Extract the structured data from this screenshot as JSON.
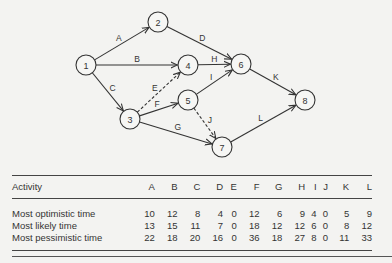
{
  "network": {
    "nodes": [
      {
        "id": "1",
        "label": "1",
        "x": 86,
        "y": 65
      },
      {
        "id": "2",
        "label": "2",
        "x": 158,
        "y": 22
      },
      {
        "id": "3",
        "label": "3",
        "x": 130,
        "y": 119
      },
      {
        "id": "4",
        "label": "4",
        "x": 188,
        "y": 65
      },
      {
        "id": "5",
        "label": "5",
        "x": 188,
        "y": 100
      },
      {
        "id": "6",
        "label": "6",
        "x": 241,
        "y": 64
      },
      {
        "id": "7",
        "label": "7",
        "x": 222,
        "y": 147
      },
      {
        "id": "8",
        "label": "8",
        "x": 305,
        "y": 100
      }
    ],
    "edges": [
      {
        "label": "A",
        "from": "1",
        "to": "2",
        "dashed": false
      },
      {
        "label": "B",
        "from": "1",
        "to": "4",
        "dashed": false
      },
      {
        "label": "C",
        "from": "1",
        "to": "3",
        "dashed": false
      },
      {
        "label": "D",
        "from": "2",
        "to": "6",
        "dashed": false
      },
      {
        "label": "E",
        "from": "3",
        "to": "4",
        "dashed": true
      },
      {
        "label": "F",
        "from": "3",
        "to": "5",
        "dashed": false
      },
      {
        "label": "G",
        "from": "3",
        "to": "7",
        "dashed": false
      },
      {
        "label": "H",
        "from": "4",
        "to": "6",
        "dashed": false
      },
      {
        "label": "I",
        "from": "5",
        "to": "6",
        "dashed": false
      },
      {
        "label": "J",
        "from": "5",
        "to": "7",
        "dashed": true
      },
      {
        "label": "K",
        "from": "6",
        "to": "8",
        "dashed": false
      },
      {
        "label": "L",
        "from": "7",
        "to": "8",
        "dashed": false
      }
    ]
  },
  "table": {
    "header": {
      "label": "Activity",
      "columns": [
        "A",
        "B",
        "C",
        "D",
        "E",
        "F",
        "G",
        "H",
        "I",
        "J",
        "K",
        "L"
      ]
    },
    "rows": [
      {
        "label": "Most optimistic time",
        "values": [
          "10",
          "12",
          "8",
          "4",
          "0",
          "12",
          "6",
          "9",
          "4",
          "0",
          "5",
          "9"
        ]
      },
      {
        "label": "Most likely time",
        "values": [
          "13",
          "15",
          "11",
          "7",
          "0",
          "18",
          "12",
          "12",
          "6",
          "0",
          "8",
          "12"
        ]
      },
      {
        "label": "Most pessimistic time",
        "values": [
          "22",
          "18",
          "20",
          "16",
          "0",
          "36",
          "18",
          "27",
          "8",
          "0",
          "11",
          "33"
        ]
      }
    ]
  }
}
